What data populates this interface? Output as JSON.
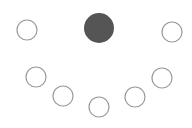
{
  "diagram": {
    "title": "",
    "stroke_color": "#9a9a9a",
    "fill_color": "#555555",
    "background": "#ffffff",
    "nodes": [
      {
        "id": "n1",
        "cx": 27,
        "cy": 30,
        "r": 10,
        "filled": false
      },
      {
        "id": "n2",
        "cx": 36,
        "cy": 77,
        "r": 10,
        "filled": false
      },
      {
        "id": "n3",
        "cx": 63,
        "cy": 96,
        "r": 10,
        "filled": false
      },
      {
        "id": "n4",
        "cx": 99,
        "cy": 107,
        "r": 10,
        "filled": false
      },
      {
        "id": "n5",
        "cx": 135,
        "cy": 97,
        "r": 10,
        "filled": false
      },
      {
        "id": "n6",
        "cx": 162,
        "cy": 78,
        "r": 10,
        "filled": false
      },
      {
        "id": "n7",
        "cx": 172,
        "cy": 32,
        "r": 10,
        "filled": false
      },
      {
        "id": "n8",
        "cx": 99,
        "cy": 28,
        "r": 15,
        "filled": true
      }
    ]
  }
}
